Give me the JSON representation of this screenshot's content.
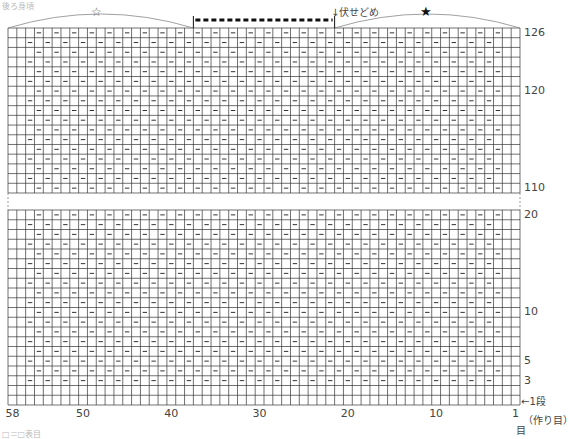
{
  "title_partial": "後ろ身頃",
  "caption_partial": "□＝□表目",
  "markers": {
    "left_bracket_symbol": "☆",
    "right_bracket_symbol": "★",
    "bind_off_label": "↓伏せどめ"
  },
  "grid": {
    "columns": 58,
    "upper_rows": {
      "from": 110,
      "to": 126
    },
    "lower_rows": {
      "from": 1,
      "to": 20
    },
    "pattern_first_col": 3,
    "pattern_last_col": 56,
    "pattern_first_row": 3,
    "bind_off_cols": {
      "from": 22,
      "to": 37
    }
  },
  "row_labels": [
    {
      "text": "126",
      "row": 126
    },
    {
      "text": "120",
      "row": 120
    },
    {
      "text": "110",
      "row": 110
    },
    {
      "text": "20",
      "row": 20
    },
    {
      "text": "10",
      "row": 10
    },
    {
      "text": "5",
      "row": 5
    },
    {
      "text": "3",
      "row": 3
    },
    {
      "text": "←1段",
      "row": 1
    }
  ],
  "col_labels": [
    {
      "text": "58",
      "col": 58
    },
    {
      "text": "50",
      "col": 50
    },
    {
      "text": "40",
      "col": 40
    },
    {
      "text": "30",
      "col": 30
    },
    {
      "text": "20",
      "col": 20
    },
    {
      "text": "10",
      "col": 10
    },
    {
      "text": "1",
      "col": 1
    }
  ],
  "cast_on_label": "（作り目）",
  "stitch_unit_label": "目",
  "colors": {
    "grid": "#333333",
    "dash": "#333333",
    "bind_off": "#111111",
    "arc": "#888888"
  }
}
